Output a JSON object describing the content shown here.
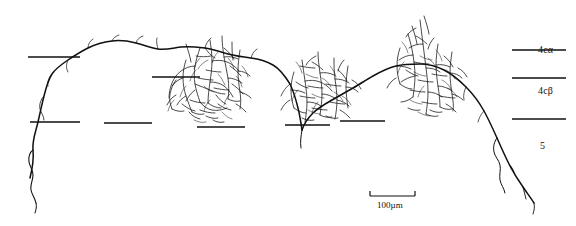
{
  "figure": {
    "type": "neuron-camera-lucida-tracing",
    "background_color": "#ffffff",
    "ink_color": "#101010",
    "width": 576,
    "height": 226,
    "layer_labels": [
      {
        "id": "layer-4c-alpha",
        "text": "4cα",
        "x": 538,
        "y": 44
      },
      {
        "id": "layer-4c-beta",
        "text": "4cβ",
        "x": 538,
        "y": 85
      },
      {
        "id": "layer-5",
        "text": "5",
        "x": 540,
        "y": 140
      }
    ],
    "scale_bar": {
      "label": "100µm",
      "x": 370,
      "y": 196,
      "length_px": 45
    },
    "dashed_boundaries": [
      {
        "id": "boundary-top-left",
        "x1": 28,
        "y1": 57,
        "x2": 80,
        "y2": 57
      },
      {
        "id": "boundary-top-right",
        "x1": 512,
        "y1": 50,
        "x2": 566,
        "y2": 50
      },
      {
        "id": "boundary-mid-left-a",
        "x1": 152,
        "y1": 77,
        "x2": 200,
        "y2": 77
      },
      {
        "id": "boundary-mid-right-a",
        "x1": 512,
        "y1": 78,
        "x2": 566,
        "y2": 78
      },
      {
        "id": "boundary-low-left",
        "x1": 30,
        "y1": 122,
        "x2": 80,
        "y2": 122
      },
      {
        "id": "boundary-low-mid-a",
        "x1": 104,
        "y1": 123,
        "x2": 152,
        "y2": 123
      },
      {
        "id": "boundary-low-mid-b",
        "x1": 197,
        "y1": 127,
        "x2": 245,
        "y2": 127
      },
      {
        "id": "boundary-low-mid-c",
        "x1": 285,
        "y1": 125,
        "x2": 330,
        "y2": 125
      },
      {
        "id": "boundary-low-mid-d",
        "x1": 340,
        "y1": 121,
        "x2": 385,
        "y2": 121
      },
      {
        "id": "boundary-low-right",
        "x1": 512,
        "y1": 119,
        "x2": 566,
        "y2": 119
      }
    ]
  }
}
